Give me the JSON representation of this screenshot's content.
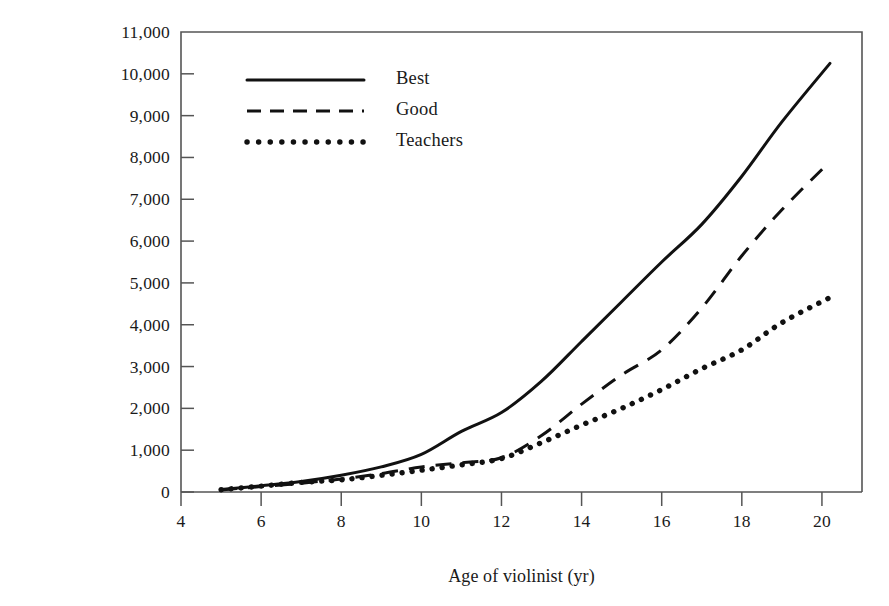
{
  "chart_data": {
    "type": "line",
    "title": "",
    "xlabel": "Age of violinist (yr)",
    "ylabel": "Estimated Accumlated\nPractice (hr)",
    "ylabel_line1": "Estimated Accumlated",
    "ylabel_line2": "Practice (hr)",
    "xlim": [
      4,
      21
    ],
    "ylim": [
      0,
      11000
    ],
    "xticks": [
      4,
      6,
      8,
      10,
      12,
      14,
      16,
      18,
      20
    ],
    "xtick_labels": [
      "4",
      "6",
      "8",
      "10",
      "12",
      "14",
      "16",
      "18",
      "20"
    ],
    "yticks": [
      0,
      1000,
      2000,
      3000,
      4000,
      5000,
      6000,
      7000,
      8000,
      9000,
      10000,
      11000
    ],
    "ytick_labels": [
      "0",
      "1,000",
      "2,000",
      "3,000",
      "4,000",
      "5,000",
      "6,000",
      "7,000",
      "8,000",
      "9,000",
      "10,000",
      "11,000"
    ],
    "grid": false,
    "legend_position": "upper left",
    "line_color": "#111111",
    "axis_color": "#555555",
    "x": [
      5,
      6,
      7,
      8,
      9,
      10,
      11,
      12,
      13,
      14,
      15,
      16,
      17,
      18,
      19,
      20.2
    ],
    "series": [
      {
        "name": "Best",
        "style": "solid",
        "values": [
          60,
          150,
          250,
          400,
          600,
          900,
          1450,
          1900,
          2650,
          3600,
          4550,
          5500,
          6400,
          7550,
          8850,
          10250
        ]
      },
      {
        "name": "Good",
        "style": "dashed",
        "values": [
          50,
          130,
          210,
          310,
          440,
          600,
          700,
          820,
          1350,
          2100,
          2800,
          3400,
          4400,
          5650,
          6750,
          7900
        ]
      },
      {
        "name": "Teachers",
        "style": "dotted",
        "values": [
          55,
          140,
          230,
          290,
          400,
          520,
          650,
          800,
          1180,
          1600,
          2000,
          2450,
          2950,
          3400,
          4050,
          4650
        ]
      }
    ]
  },
  "legend": {
    "entries": [
      {
        "label": "Best",
        "style": "solid"
      },
      {
        "label": "Good",
        "style": "dashed"
      },
      {
        "label": "Teachers",
        "style": "dotted"
      }
    ]
  }
}
